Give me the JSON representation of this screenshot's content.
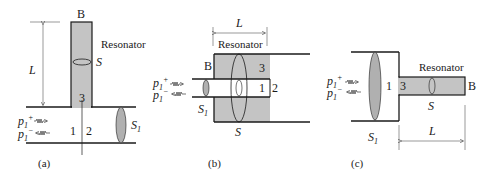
{
  "colors": {
    "line": "#1a1a1a",
    "fill": "#c4c4c4",
    "ellipse_fill": "#b0b0b0",
    "background": "#ffffff"
  },
  "panels": [
    {
      "id": "a",
      "caption": "(a)",
      "top_label": "B",
      "resonator_label": "Resonator",
      "length_label": "L",
      "area_resonator": "S",
      "area_duct": "S",
      "area_duct_sub": "1",
      "junction_labels": [
        "1",
        "2",
        "3"
      ],
      "wave_in": "p",
      "wave_in_sub": "1",
      "wave_in_sup": "+",
      "wave_out": "p",
      "wave_out_sub": "1",
      "wave_out_sup": "−"
    },
    {
      "id": "b",
      "caption": "(b)",
      "top_label": "B",
      "resonator_label": "Resonator",
      "length_label": "L",
      "area_resonator": "S",
      "area_duct": "S",
      "area_duct_sub": "1",
      "junction_labels": [
        "1",
        "2",
        "3"
      ],
      "wave_in": "p",
      "wave_in_sub": "1",
      "wave_in_sup": "+",
      "wave_out": "p",
      "wave_out_sub": "1",
      "wave_out_sup": "−"
    },
    {
      "id": "c",
      "caption": "(c)",
      "top_label": "B",
      "resonator_label": "Resonator",
      "length_label": "L",
      "area_resonator": "S",
      "area_duct": "S",
      "area_duct_sub": "1",
      "junction_labels": [
        "1",
        "3"
      ],
      "wave_in": "p",
      "wave_in_sub": "1",
      "wave_in_sup": "+",
      "wave_out": "p",
      "wave_out_sub": "1",
      "wave_out_sup": "−"
    }
  ]
}
